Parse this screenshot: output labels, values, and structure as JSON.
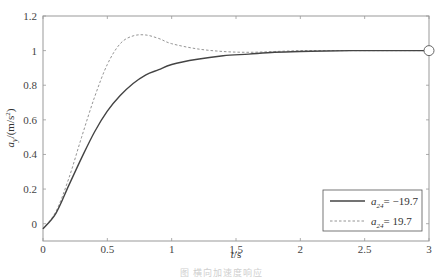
{
  "chart_data": {
    "type": "line",
    "title": "",
    "xlabel": "t/s",
    "ylabel": "a_y/(m/s²)",
    "xlim": [
      0,
      3
    ],
    "ylim": [
      -0.1,
      1.2
    ],
    "xticks": [
      0,
      0.5,
      1,
      1.5,
      2,
      2.5,
      3
    ],
    "xtick_labels": [
      "0",
      "0.5",
      "1",
      "1.5",
      "2",
      "2.5",
      "3"
    ],
    "yticks": [
      0,
      0.2,
      0.4,
      0.6,
      0.8,
      1,
      1.2
    ],
    "ytick_labels": [
      "0",
      "0.2",
      "0.4",
      "0.6",
      "0.8",
      "1",
      "1.2"
    ],
    "grid": false,
    "legend_position": "lower right",
    "x": [
      0,
      0.1,
      0.2,
      0.3,
      0.4,
      0.5,
      0.6,
      0.7,
      0.8,
      0.9,
      1.0,
      1.2,
      1.4,
      1.6,
      1.8,
      2.0,
      2.2,
      2.4,
      2.6,
      2.8,
      3.0
    ],
    "series": [
      {
        "name": "a24 = -19.7",
        "style": "solid",
        "color": "#444444",
        "values": [
          -0.03,
          0.06,
          0.22,
          0.38,
          0.53,
          0.65,
          0.74,
          0.81,
          0.86,
          0.89,
          0.92,
          0.95,
          0.97,
          0.98,
          0.99,
          0.995,
          0.998,
          1.0,
          1.0,
          1.0,
          1.0
        ]
      },
      {
        "name": "a24 = 19.7",
        "style": "dashed",
        "color": "#888888",
        "values": [
          -0.03,
          0.07,
          0.26,
          0.5,
          0.73,
          0.92,
          1.04,
          1.085,
          1.09,
          1.07,
          1.04,
          1.01,
          0.995,
          0.99,
          0.995,
          1.0,
          1.0,
          1.0,
          1.0,
          1.0,
          1.0
        ]
      }
    ],
    "annotations": [
      {
        "type": "circle-marker",
        "x": 3,
        "y": 1
      }
    ]
  },
  "legend": {
    "items": [
      {
        "symbol": "a",
        "subscript": "24",
        "eq": "= −19.7"
      },
      {
        "symbol": "a",
        "subscript": "24",
        "eq": "= 19.7"
      }
    ]
  },
  "axes": {
    "xlabel_var": "t",
    "xlabel_unit": "/s",
    "ylabel_var": "a",
    "ylabel_sub": "y",
    "ylabel_unit": "/(m/s",
    "ylabel_sup": "2",
    "ylabel_close": ")"
  },
  "caption": "图 横向加速度响应"
}
